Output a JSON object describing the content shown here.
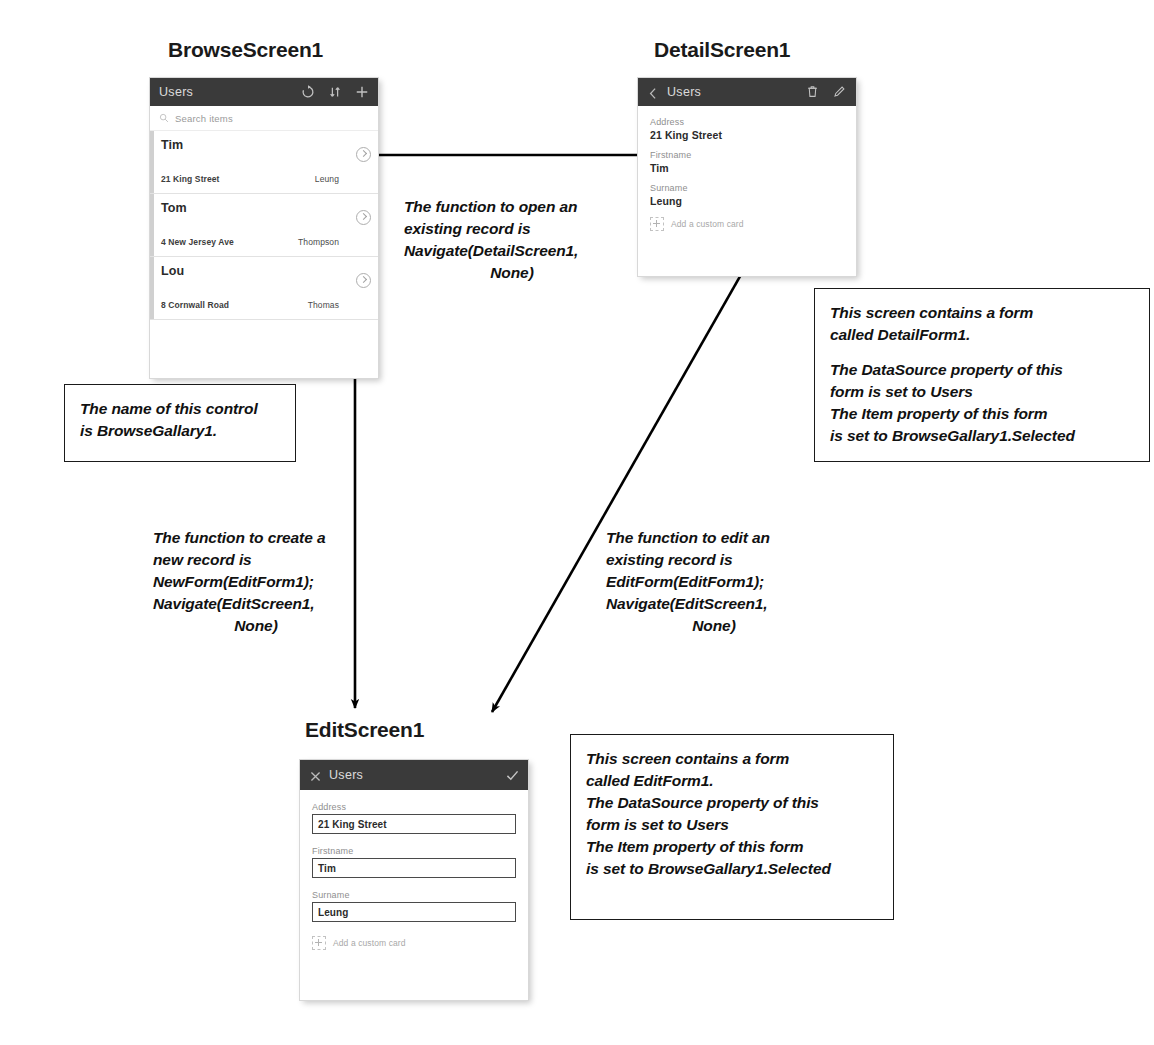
{
  "screens": {
    "browse": {
      "title": "BrowseScreen1",
      "header_label": "Users",
      "icons": [
        "refresh-icon",
        "sort-icon",
        "add-icon"
      ],
      "search_placeholder": "Search items",
      "rows": [
        {
          "name": "Tim",
          "address": "21 King Street",
          "surname": "Leung"
        },
        {
          "name": "Tom",
          "address": "4 New Jersey Ave",
          "surname": "Thompson"
        },
        {
          "name": "Lou",
          "address": "8 Cornwall Road",
          "surname": "Thomas"
        }
      ]
    },
    "detail": {
      "title": "DetailScreen1",
      "header_label": "Users",
      "icons": [
        "back-icon",
        "delete-icon",
        "edit-icon"
      ],
      "fields": [
        {
          "label": "Address",
          "value": "21 King Street"
        },
        {
          "label": "Firstname",
          "value": "Tim"
        },
        {
          "label": "Surname",
          "value": "Leung"
        }
      ],
      "add_custom_card": "Add a custom card"
    },
    "edit": {
      "title": "EditScreen1",
      "header_label": "Users",
      "icons": [
        "close-icon",
        "check-icon"
      ],
      "fields": [
        {
          "label": "Address",
          "value": "21 King Street"
        },
        {
          "label": "Firstname",
          "value": "Tim"
        },
        {
          "label": "Surname",
          "value": "Leung"
        }
      ],
      "add_custom_card": "Add a custom card"
    }
  },
  "callouts": {
    "gallery_name": {
      "line1": "The name of this control",
      "line2": "is BrowseGallary1."
    },
    "detail_form": {
      "line1": "This screen contains a form",
      "line2": "called DetailForm1.",
      "line3": "The DataSource property of this",
      "line4": "form is set to Users",
      "line5": "The Item property of this form",
      "line6": "is set to BrowseGallary1.Selected"
    },
    "edit_form": {
      "line1": "This screen contains a form",
      "line2": "called EditForm1.",
      "line3": "The DataSource property of this",
      "line4": "form is set to Users",
      "line5": "The Item property of this form",
      "line6": "is set to BrowseGallary1.Selected"
    }
  },
  "annotations": {
    "open_record": {
      "line1": "The function to open an",
      "line2": "existing record is",
      "line3": "Navigate(DetailScreen1,",
      "line4": "None)"
    },
    "new_record": {
      "line1": "The function to create a",
      "line2": "new record is",
      "line3": "NewForm(EditForm1);",
      "line4": "Navigate(EditScreen1,",
      "line5": "None)"
    },
    "edit_record": {
      "line1": "The function to edit an",
      "line2": "existing record is",
      "line3": "EditForm(EditForm1);",
      "line4": "Navigate(EditScreen1,",
      "line5": "None)"
    }
  },
  "colors": {
    "header_bar": "#3a3a3a",
    "arrow": "#000000",
    "callout_border": "#1a1a1a"
  }
}
